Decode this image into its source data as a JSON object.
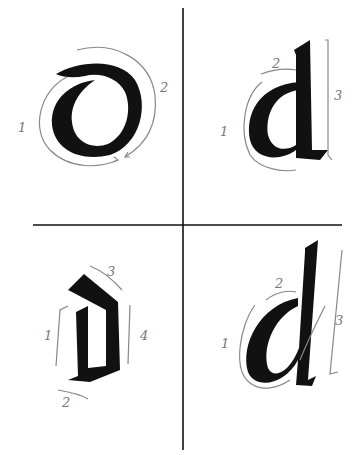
{
  "figure": {
    "quadrants": [
      {
        "id": "uncial-d",
        "position": "top-left",
        "stroke_labels": [
          "1",
          "2"
        ]
      },
      {
        "id": "foundational-d",
        "position": "top-right",
        "stroke_labels": [
          "1",
          "2",
          "3"
        ]
      },
      {
        "id": "blackletter-d",
        "position": "bottom-left",
        "stroke_labels": [
          "1",
          "2",
          "3",
          "4"
        ]
      },
      {
        "id": "italic-d",
        "position": "bottom-right",
        "stroke_labels": [
          "1",
          "2",
          "3"
        ]
      }
    ],
    "colors": {
      "ink": "#111111",
      "guide": "#888888",
      "label": "#777777"
    }
  }
}
